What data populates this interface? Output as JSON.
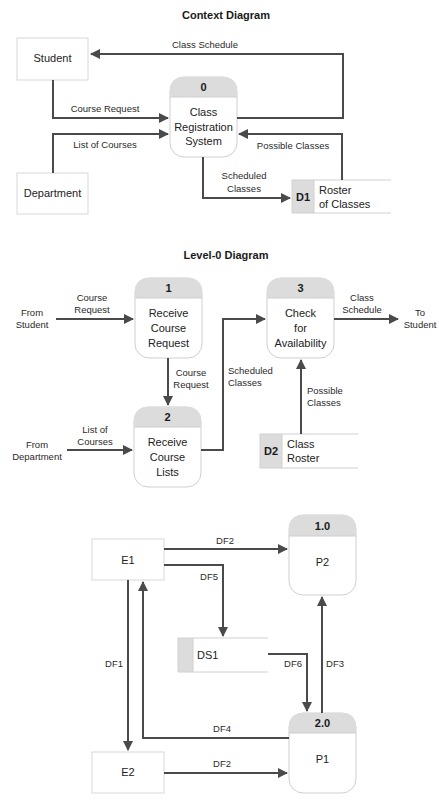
{
  "colors": {
    "flow": "#4a4a4a",
    "process_header": "#dcdcdc",
    "box_border": "#d8d8d8",
    "background": "#ffffff"
  },
  "context": {
    "title": "Context Diagram",
    "entities": {
      "student": "Student",
      "department": "Department"
    },
    "process": {
      "id": "0",
      "line1": "Class",
      "line2": "Registration",
      "line3": "System"
    },
    "store": {
      "id": "D1",
      "line1": "Roster",
      "line2": "of Classes"
    },
    "flows": {
      "class_schedule": "Class Schedule",
      "course_request": "Course Request",
      "list_of_courses": "List of Courses",
      "possible_classes": "Possible Classes",
      "scheduled_line1": "Scheduled",
      "scheduled_line2": "Classes"
    }
  },
  "level0": {
    "title": "Level-0 Diagram",
    "sources": {
      "from_student_1": "From",
      "from_student_2": "Student",
      "from_dept_1": "From",
      "from_dept_2": "Department",
      "to_student_1": "To",
      "to_student_2": "Student"
    },
    "processes": [
      {
        "id": "1",
        "line1": "Receive",
        "line2": "Course",
        "line3": "Request"
      },
      {
        "id": "2",
        "line1": "Receive",
        "line2": "Course",
        "line3": "Lists"
      },
      {
        "id": "3",
        "line1": "Check",
        "line2": "for",
        "line3": "Availability"
      }
    ],
    "store": {
      "id": "D2",
      "line1": "Class",
      "line2": "Roster"
    },
    "flows": {
      "course_request_in_1": "Course",
      "course_request_in_2": "Request",
      "course_request_mid_1": "Course",
      "course_request_mid_2": "Request",
      "list_courses_1": "List of",
      "list_courses_2": "Courses",
      "scheduled_1": "Scheduled",
      "scheduled_2": "Classes",
      "possible_1": "Possible",
      "possible_2": "Classes",
      "class_schedule_1": "Class",
      "class_schedule_2": "Schedule"
    }
  },
  "generic": {
    "entities": {
      "e1": "E1",
      "e2": "E2"
    },
    "processes": [
      {
        "id": "1.0",
        "name": "P2"
      },
      {
        "id": "2.0",
        "name": "P1"
      }
    ],
    "store": {
      "name": "DS1"
    },
    "flows": {
      "e1_to_p2": "DF2",
      "e1_to_ds1": "DF5",
      "e1_to_e2": "DF1",
      "ds1_to_p1": "DF6",
      "p1_to_p2": "DF3",
      "p1_to_e1": "DF4",
      "e2_to_p1": "DF2"
    }
  }
}
